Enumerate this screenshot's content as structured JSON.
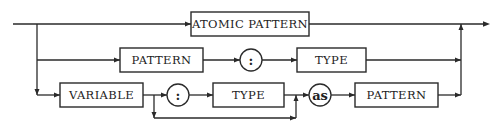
{
  "diagram": {
    "type": "syntax-railroad-diagram",
    "colors": {
      "stroke": "#2a2a2a",
      "text": "#222222",
      "background": "#ffffff"
    },
    "rows": [
      {
        "name": "row-atomic",
        "items": [
          {
            "kind": "nonterminal",
            "label": "ATOMIC PATTERN"
          }
        ]
      },
      {
        "name": "row-typed-pattern",
        "items": [
          {
            "kind": "nonterminal",
            "label": "PATTERN"
          },
          {
            "kind": "terminal",
            "label": ":"
          },
          {
            "kind": "nonterminal",
            "label": "TYPE"
          }
        ]
      },
      {
        "name": "row-variable",
        "items": [
          {
            "kind": "nonterminal",
            "label": "VARIABLE"
          },
          {
            "kind": "terminal",
            "label": ":"
          },
          {
            "kind": "nonterminal",
            "label": "TYPE"
          },
          {
            "kind": "terminal",
            "label": "as"
          },
          {
            "kind": "nonterminal",
            "label": "PATTERN"
          }
        ],
        "optional_bypass": {
          "skips": [
            ":",
            "TYPE"
          ]
        }
      }
    ]
  }
}
